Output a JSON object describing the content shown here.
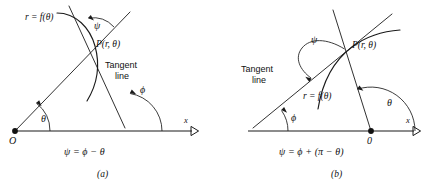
{
  "figure": {
    "kind": "math-diagram",
    "ink_color": "#1a1a1a",
    "background_color": "#ffffff"
  },
  "panel_a": {
    "caption": "(a)",
    "equation": "ψ = ϕ − θ",
    "labels": {
      "curve": "r = f(θ)",
      "point": "P(r, θ)",
      "tangent_line_1": "Tangent",
      "tangent_line_2": "line",
      "origin": "O",
      "axis": "x",
      "angle_psi": "ψ",
      "angle_phi": "ϕ",
      "angle_theta": "θ"
    }
  },
  "panel_b": {
    "caption": "(b)",
    "equation": "ψ = ϕ + (π − θ)",
    "labels": {
      "curve": "r = f(θ)",
      "point": "P(r, θ)",
      "tangent_line_1": "Tangent",
      "tangent_line_2": "line",
      "origin": "0",
      "axis": "x",
      "angle_psi": "ψ",
      "angle_phi": "ϕ",
      "angle_theta": "θ"
    }
  }
}
